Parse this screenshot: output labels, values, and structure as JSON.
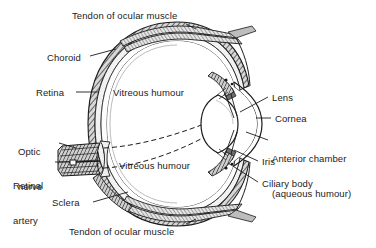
{
  "figure": {
    "background_color": "#ffffff",
    "ink_color": "#1b1b1b",
    "width": 376,
    "height": 248
  },
  "labels": {
    "tendon_top": "Tendon of ocular muscle",
    "tendon_bottom": "Tendon of ocular muscle",
    "choroid": "Choroid",
    "retina": "Retina",
    "optic_nerve_l1": "Optic",
    "optic_nerve_l2": "nerve",
    "retinal_artery_l1": "Retinal",
    "retinal_artery_l2": "artery",
    "sclera": "Sclera",
    "vitreous_upper": "Vitreous humour",
    "vitreous_lower": "Vitreous humour",
    "lens": "Lens",
    "cornea": "Cornea",
    "anterior_chamber_l1": "Anterior chamber",
    "anterior_chamber_l2": "(aqueous humour)",
    "iris": "Iris",
    "ciliary_body": "Ciliary body"
  },
  "structures": [
    {
      "name": "sclera",
      "description": "outer fibrous coat, hatched dark band"
    },
    {
      "name": "choroid",
      "description": "middle vascular coat"
    },
    {
      "name": "retina",
      "description": "inner neural coat"
    },
    {
      "name": "vitreous-humour",
      "description": "gel filling posterior cavity"
    },
    {
      "name": "lens",
      "description": "biconvex lens behind iris"
    },
    {
      "name": "cornea",
      "description": "transparent anterior bulge"
    },
    {
      "name": "anterior-chamber",
      "description": "space with aqueous humour"
    },
    {
      "name": "iris",
      "description": "pigmented diaphragm"
    },
    {
      "name": "ciliary-body",
      "description": "ring of muscle and processes"
    },
    {
      "name": "optic-nerve",
      "description": "nerve exiting posteriorly"
    },
    {
      "name": "retinal-artery",
      "description": "central artery entering optic nerve"
    },
    {
      "name": "tendon-of-ocular-muscle",
      "description": "extraocular muscle tendon insertions"
    }
  ]
}
